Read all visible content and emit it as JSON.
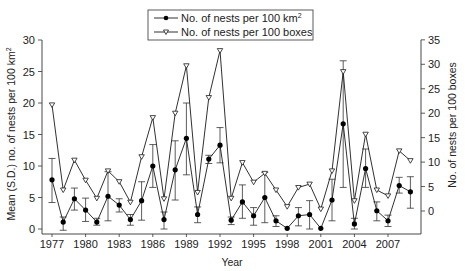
{
  "chart_data": {
    "type": "line",
    "title": "",
    "xlabel": "Year",
    "ylabel": "Mean (S.D.) no. of nests per 100 km²",
    "y2label": "No. of nests per 100 boxes",
    "xlim": [
      1977,
      2009
    ],
    "ylim": [
      0,
      30
    ],
    "y2lim": [
      0,
      35
    ],
    "x_ticks": [
      1977,
      1980,
      1983,
      1986,
      1989,
      1992,
      1995,
      1998,
      2001,
      2004,
      2007
    ],
    "y_ticks": [
      0,
      5,
      10,
      15,
      20,
      25,
      30
    ],
    "y2_ticks": [
      0,
      5,
      10,
      15,
      20,
      25,
      30,
      35
    ],
    "grid": false,
    "legend_position": "top-center",
    "x": [
      1977,
      1978,
      1979,
      1980,
      1981,
      1982,
      1983,
      1984,
      1985,
      1986,
      1987,
      1988,
      1989,
      1990,
      1991,
      1992,
      1993,
      1994,
      1995,
      1996,
      1997,
      1998,
      1999,
      2000,
      2001,
      2002,
      2003,
      2004,
      2005,
      2006,
      2007,
      2008,
      2009
    ],
    "series": [
      {
        "name": "No. of nests per 100 km²",
        "axis": "left",
        "marker": "filled-circle",
        "values": [
          7.8,
          1.1,
          4.8,
          3.0,
          1.1,
          5.2,
          3.8,
          1.5,
          4.5,
          10.0,
          1.5,
          9.4,
          14.4,
          2.3,
          11.1,
          13.3,
          1.4,
          4.3,
          2.1,
          5.0,
          1.3,
          0.1,
          2.1,
          2.3,
          0.1,
          4.6,
          16.7,
          0.8,
          9.6,
          2.9,
          1.3,
          6.9,
          5.9
        ],
        "sd_upper": [
          11.2,
          1.9,
          6.5,
          4.9,
          1.7,
          9.1,
          4.8,
          2.3,
          7.5,
          13.4,
          2.7,
          14.0,
          20.0,
          3.5,
          11.7,
          16.1,
          1.9,
          7.0,
          3.4,
          9.0,
          2.1,
          0.1,
          3.4,
          4.5,
          0.1,
          7.9,
          26.7,
          1.7,
          12.7,
          4.3,
          2.2,
          8.2,
          8.3
        ],
        "sd_lower": [
          4.2,
          -0.2,
          3.0,
          1.2,
          0.6,
          1.3,
          2.7,
          0.6,
          1.4,
          6.6,
          0.0,
          4.6,
          8.6,
          1.0,
          10.4,
          10.5,
          0.7,
          1.7,
          0.6,
          1.0,
          0.4,
          0.1,
          0.5,
          0.0,
          0.1,
          1.3,
          6.6,
          0.0,
          6.6,
          1.3,
          0.4,
          5.7,
          3.3
        ]
      },
      {
        "name": "No. of nests per 100 boxes",
        "axis": "right",
        "marker": "open-triangle-down",
        "values": [
          21.7,
          4.3,
          10.4,
          6.3,
          2.6,
          8.2,
          6.0,
          1.8,
          11.1,
          19.1,
          2.5,
          20.0,
          29.7,
          3.8,
          23.2,
          32.8,
          2.6,
          9.9,
          5.9,
          7.7,
          4.3,
          0.9,
          4.8,
          5.5,
          0.4,
          8.2,
          28.5,
          2.1,
          15.7,
          4.3,
          3.1,
          12.3,
          10.3
        ]
      }
    ]
  },
  "legend": {
    "items": [
      {
        "label": "No. of nests per 100 km",
        "sup": "2"
      },
      {
        "label": "No. of nests per 100 boxes",
        "sup": ""
      }
    ]
  },
  "axes": {
    "x_title": "Year",
    "y_left_title": "Mean (S.D.) no. of nests per 100 km",
    "y_left_sup": "2",
    "y_right_title": "No. of nests per 100 boxes"
  },
  "colors": {
    "line": "#1a1a1a",
    "marker_fill": "#000000",
    "open_marker_fill": "#ffffff",
    "error_bar": "#333333"
  }
}
